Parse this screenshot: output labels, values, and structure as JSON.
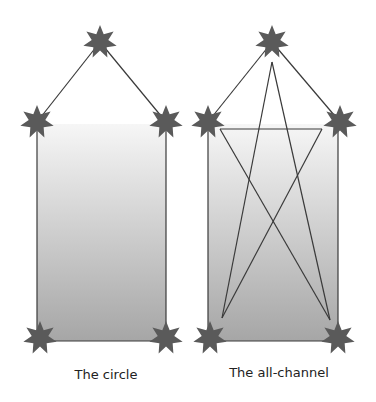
{
  "colors": {
    "star": "#5a5a5a",
    "line": "#3a3a3a",
    "gradient_top": "#f4f4f4",
    "gradient_bottom": "#a6a6a6",
    "background": "#ffffff"
  },
  "diagrams": [
    {
      "name": "circle",
      "caption": "The circle",
      "nodes": [
        {
          "id": "top",
          "x": 100,
          "y": 42
        },
        {
          "id": "upper-left",
          "x": 37,
          "y": 122
        },
        {
          "id": "upper-right",
          "x": 166,
          "y": 122
        },
        {
          "id": "lower-left",
          "x": 40,
          "y": 338
        },
        {
          "id": "lower-right",
          "x": 166,
          "y": 338
        }
      ]
    },
    {
      "name": "all-channel",
      "caption": "The all-channel",
      "nodes": [
        {
          "id": "top",
          "x": 272,
          "y": 42
        },
        {
          "id": "upper-left",
          "x": 208,
          "y": 122
        },
        {
          "id": "upper-right",
          "x": 340,
          "y": 122
        },
        {
          "id": "lower-left",
          "x": 210,
          "y": 338
        },
        {
          "id": "lower-right",
          "x": 338,
          "y": 338
        }
      ]
    }
  ]
}
